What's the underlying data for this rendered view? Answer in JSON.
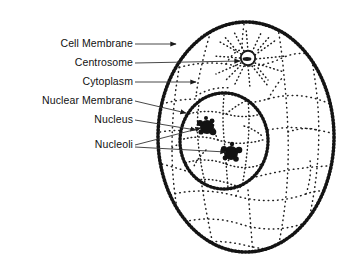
{
  "figure": {
    "background_color": "#ffffff",
    "ink_color": "#111111",
    "leader_color": "#333333"
  },
  "labels": [
    {
      "id": "cell-membrane",
      "text": "Cell Membrane",
      "right": 133,
      "top": 38,
      "line": {
        "x1": 135,
        "y1": 44,
        "x2": 176,
        "y2": 44
      }
    },
    {
      "id": "centrosome",
      "text": "Centrosome",
      "right": 133,
      "top": 57,
      "line": {
        "x1": 135,
        "y1": 63,
        "x2": 240,
        "y2": 61
      }
    },
    {
      "id": "cytoplasm",
      "text": "Cytoplasm",
      "right": 133,
      "top": 76,
      "line": {
        "x1": 135,
        "y1": 82,
        "x2": 196,
        "y2": 82
      }
    },
    {
      "id": "nuclear-membrane",
      "text": "Nuclear Membrane",
      "right": 133,
      "top": 95,
      "line": {
        "x1": 135,
        "y1": 101,
        "x2": 186,
        "y2": 113
      }
    },
    {
      "id": "nucleus",
      "text": "Nucleus",
      "right": 133,
      "top": 114,
      "line": {
        "x1": 135,
        "y1": 120,
        "x2": 196,
        "y2": 130
      }
    },
    {
      "id": "nucleoli",
      "text": "Nucleoli",
      "right": 133,
      "top": 139,
      "line": {
        "x1": 135,
        "y1": 145,
        "x2": 204,
        "y2": 127
      },
      "line2": {
        "x1": 135,
        "y1": 147,
        "x2": 228,
        "y2": 152
      }
    }
  ],
  "structures": {
    "cell": {
      "name": "cell-membrane-outline",
      "cx": 246,
      "cy": 137,
      "rx": 88,
      "ry": 115
    },
    "centrosome": {
      "name": "centrosome",
      "cx": 248,
      "cy": 58,
      "r": 7
    },
    "nucleus": {
      "name": "nucleus-outline",
      "cx": 224,
      "cy": 141,
      "rx": 44,
      "ry": 48
    },
    "nucleoli": [
      {
        "name": "nucleolus-upper",
        "cx": 207,
        "cy": 127,
        "r": 7
      },
      {
        "name": "nucleolus-lower",
        "cx": 231,
        "cy": 153,
        "r": 7
      }
    ]
  }
}
